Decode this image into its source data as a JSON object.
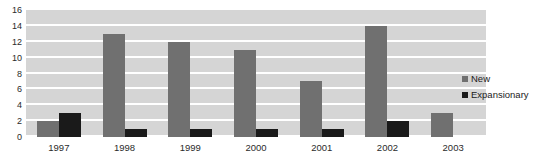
{
  "chart_data": {
    "type": "bar",
    "title": "",
    "xlabel": "",
    "ylabel": "",
    "ylim": [
      0,
      16
    ],
    "ytick_step": 2,
    "yticks": [
      16,
      14,
      12,
      10,
      8,
      6,
      4,
      2,
      0
    ],
    "categories": [
      "1997",
      "1998",
      "1999",
      "2000",
      "2001",
      "2002",
      "2003"
    ],
    "series": [
      {
        "name": "New",
        "color": "#707070",
        "values": [
          2,
          13,
          12,
          11,
          7,
          14,
          3
        ]
      },
      {
        "name": "Expansionary",
        "color": "#1a1a1a",
        "values": [
          3,
          1,
          1,
          1,
          1,
          2,
          0
        ]
      }
    ],
    "grid": true,
    "grid_color": "#ffffff",
    "plot_background": "#d5d5d5",
    "legend_position": "right"
  },
  "legend": {
    "entries": [
      {
        "label": "New",
        "color": "#707070"
      },
      {
        "label": "Expansionary",
        "color": "#1a1a1a"
      }
    ]
  },
  "title_sliver": {
    "text": ""
  }
}
